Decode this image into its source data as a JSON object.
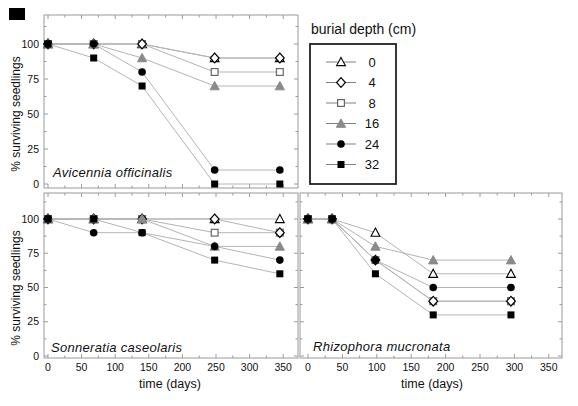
{
  "colors": {
    "black": "#000000",
    "gray_marker": "#8a8a8a",
    "series_line": "#b4b4b4",
    "legend_line": "#808080",
    "panel_border": "#9a9a9a",
    "legend_border": "#222222",
    "text": "#111111"
  },
  "legend": {
    "title": "burial depth (cm)",
    "entries": [
      {
        "label": "0",
        "marker": "triangle-open"
      },
      {
        "label": "4",
        "marker": "diamond-open"
      },
      {
        "label": "8",
        "marker": "square-open"
      },
      {
        "label": "16",
        "marker": "triangle-gray"
      },
      {
        "label": "24",
        "marker": "circle-filled"
      },
      {
        "label": "32",
        "marker": "square-filled"
      }
    ]
  },
  "axis": {
    "x_title": "time (days)",
    "y_title": "% surviving seedlings",
    "xticks": [
      0,
      50,
      100,
      150,
      200,
      250,
      300,
      350
    ],
    "yticks": [
      0,
      25,
      50,
      75,
      100
    ]
  },
  "misc": {
    "scan_artifact": "small black blotch in top-left corner of scanned figure"
  },
  "chart_data": [
    {
      "type": "line",
      "title": "Avicennia officinalis",
      "xlabel": "",
      "ylabel": "% surviving seedlings",
      "xlim": [
        -7,
        372
      ],
      "ylim": [
        0,
        120
      ],
      "x": [
        0,
        68,
        140,
        248,
        345
      ],
      "series": [
        {
          "name": "0",
          "marker": "triangle-open",
          "values": [
            100,
            100,
            100,
            90,
            90
          ]
        },
        {
          "name": "4",
          "marker": "diamond-open",
          "values": [
            100,
            100,
            100,
            90,
            90
          ]
        },
        {
          "name": "8",
          "marker": "square-open",
          "values": [
            100,
            100,
            100,
            80,
            80
          ]
        },
        {
          "name": "16",
          "marker": "triangle-gray",
          "values": [
            100,
            100,
            90,
            70,
            70
          ]
        },
        {
          "name": "24",
          "marker": "circle-filled",
          "values": [
            100,
            100,
            80,
            10,
            10
          ]
        },
        {
          "name": "32",
          "marker": "square-filled",
          "values": [
            100,
            90,
            70,
            0,
            0
          ]
        }
      ]
    },
    {
      "type": "line",
      "title": "Sonneratia caseolaris",
      "xlabel": "time (days)",
      "ylabel": "% surviving seedlings",
      "xlim": [
        -7,
        372
      ],
      "ylim": [
        0,
        120
      ],
      "x": [
        0,
        68,
        140,
        248,
        345
      ],
      "series": [
        {
          "name": "0",
          "marker": "triangle-open",
          "values": [
            100,
            100,
            100,
            100,
            100
          ]
        },
        {
          "name": "4",
          "marker": "diamond-open",
          "values": [
            100,
            100,
            100,
            100,
            90
          ]
        },
        {
          "name": "8",
          "marker": "square-open",
          "values": [
            100,
            100,
            100,
            90,
            90
          ]
        },
        {
          "name": "16",
          "marker": "triangle-gray",
          "values": [
            100,
            100,
            100,
            80,
            80
          ]
        },
        {
          "name": "24",
          "marker": "circle-filled",
          "values": [
            100,
            90,
            90,
            80,
            70
          ]
        },
        {
          "name": "32",
          "marker": "square-filled",
          "values": [
            100,
            100,
            90,
            70,
            60
          ]
        }
      ]
    },
    {
      "type": "line",
      "title": "Rhizophora mucronata",
      "xlabel": "time (days)",
      "ylabel": "",
      "xlim": [
        -12,
        369
      ],
      "ylim": [
        0,
        120
      ],
      "x": [
        0,
        35,
        98,
        182,
        295
      ],
      "series": [
        {
          "name": "0",
          "marker": "triangle-open",
          "values": [
            100,
            100,
            90,
            60,
            60
          ]
        },
        {
          "name": "4",
          "marker": "diamond-open",
          "values": [
            100,
            100,
            70,
            40,
            40
          ]
        },
        {
          "name": "8",
          "marker": "square-open",
          "values": [
            100,
            100,
            70,
            40,
            40
          ]
        },
        {
          "name": "16",
          "marker": "triangle-gray",
          "values": [
            100,
            100,
            80,
            70,
            70
          ]
        },
        {
          "name": "24",
          "marker": "circle-filled",
          "values": [
            100,
            100,
            70,
            50,
            50
          ]
        },
        {
          "name": "32",
          "marker": "square-filled",
          "values": [
            100,
            100,
            60,
            30,
            30
          ]
        }
      ]
    }
  ]
}
